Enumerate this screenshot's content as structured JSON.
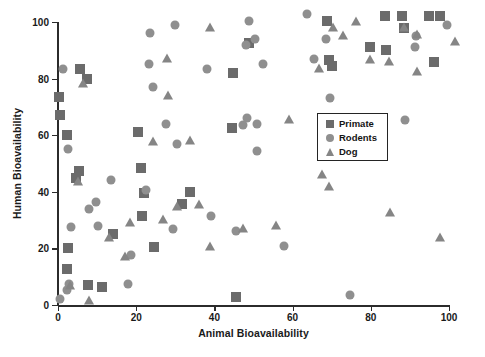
{
  "chart_data": {
    "type": "scatter",
    "title": "",
    "xlabel": "Animal Bioavailability",
    "ylabel": "Human Bioavailability",
    "xlim": [
      0,
      100
    ],
    "ylim": [
      0,
      100
    ],
    "xticks": [
      0,
      20,
      40,
      60,
      80,
      100
    ],
    "yticks": [
      0,
      20,
      40,
      60,
      80,
      100
    ],
    "grid": false,
    "legend_position": "center-right-inside",
    "series": [
      {
        "name": "Primate",
        "marker": "square",
        "color": "#6b6b6b",
        "points": [
          [
            0.3,
            73.5
          ],
          [
            0.6,
            67.0
          ],
          [
            2.3,
            60.0
          ],
          [
            2.6,
            20.0
          ],
          [
            2.2,
            12.8
          ],
          [
            4.6,
            45.0
          ],
          [
            5.6,
            83.5
          ],
          [
            7.4,
            80.0
          ],
          [
            5.4,
            47.5
          ],
          [
            7.6,
            7.0
          ],
          [
            11.2,
            6.5
          ],
          [
            14.0,
            25.0
          ],
          [
            20.4,
            61.0
          ],
          [
            21.2,
            48.5
          ],
          [
            21.4,
            31.5
          ],
          [
            22.0,
            39.5
          ],
          [
            24.6,
            20.5
          ],
          [
            31.8,
            35.8
          ],
          [
            33.8,
            40.0
          ],
          [
            44.8,
            82.0
          ],
          [
            44.5,
            62.5
          ],
          [
            45.4,
            3.0
          ],
          [
            48.8,
            92.5
          ],
          [
            69.2,
            86.5
          ],
          [
            70.2,
            84.5
          ],
          [
            68.8,
            100.5
          ],
          [
            79.8,
            91.0
          ],
          [
            83.6,
            102.0
          ],
          [
            84.0,
            90.0
          ],
          [
            88.0,
            102.0
          ],
          [
            88.6,
            98.0
          ],
          [
            95.0,
            102.0
          ],
          [
            97.6,
            102.0
          ],
          [
            96.2,
            86.0
          ]
        ]
      },
      {
        "name": "Rodents",
        "marker": "circle",
        "color": "#8f8f8f",
        "points": [
          [
            0.4,
            2.0
          ],
          [
            1.2,
            83.5
          ],
          [
            2.6,
            55.0
          ],
          [
            2.8,
            7.5
          ],
          [
            2.4,
            5.2
          ],
          [
            3.4,
            27.5
          ],
          [
            8.0,
            34.0
          ],
          [
            9.6,
            36.5
          ],
          [
            10.2,
            28.0
          ],
          [
            13.6,
            44.2
          ],
          [
            18.0,
            7.5
          ],
          [
            18.6,
            17.5
          ],
          [
            23.2,
            85.0
          ],
          [
            23.6,
            96.0
          ],
          [
            24.2,
            77.0
          ],
          [
            22.4,
            40.5
          ],
          [
            27.6,
            64.0
          ],
          [
            29.4,
            27.0
          ],
          [
            30.0,
            99.0
          ],
          [
            30.4,
            57.0
          ],
          [
            39.2,
            31.5
          ],
          [
            38.2,
            83.5
          ],
          [
            45.6,
            26.0
          ],
          [
            47.4,
            63.5
          ],
          [
            48.4,
            66.0
          ],
          [
            48.2,
            92.0
          ],
          [
            48.8,
            100.5
          ],
          [
            50.4,
            94.0
          ],
          [
            50.8,
            64.0
          ],
          [
            50.8,
            54.5
          ],
          [
            52.4,
            85.0
          ],
          [
            57.8,
            21.0
          ],
          [
            63.8,
            103.0
          ],
          [
            65.4,
            87.0
          ],
          [
            68.6,
            94.0
          ],
          [
            69.6,
            73.0
          ],
          [
            74.8,
            3.5
          ],
          [
            88.8,
            65.5
          ],
          [
            91.6,
            95.0
          ],
          [
            91.4,
            91.0
          ],
          [
            99.6,
            99.0
          ]
        ]
      },
      {
        "name": "Dog",
        "marker": "triangle",
        "color": "#858585",
        "points": [
          [
            3.0,
            6.8
          ],
          [
            5.0,
            43.5
          ],
          [
            6.4,
            78.0
          ],
          [
            8.0,
            1.5
          ],
          [
            13.0,
            23.5
          ],
          [
            17.2,
            17.0
          ],
          [
            18.4,
            29.0
          ],
          [
            26.8,
            30.0
          ],
          [
            30.4,
            34.5
          ],
          [
            24.2,
            57.5
          ],
          [
            27.8,
            87.0
          ],
          [
            28.2,
            74.0
          ],
          [
            33.8,
            58.0
          ],
          [
            36.0,
            35.5
          ],
          [
            39.0,
            20.5
          ],
          [
            38.8,
            98.0
          ],
          [
            47.4,
            26.8
          ],
          [
            55.8,
            28.0
          ],
          [
            59.2,
            65.5
          ],
          [
            67.6,
            46.0
          ],
          [
            69.4,
            41.8
          ],
          [
            66.8,
            83.5
          ],
          [
            70.4,
            98.0
          ],
          [
            72.8,
            95.0
          ],
          [
            76.2,
            100.0
          ],
          [
            79.8,
            86.5
          ],
          [
            84.8,
            32.5
          ],
          [
            84.6,
            86.0
          ],
          [
            88.6,
            98.0
          ],
          [
            91.8,
            95.5
          ],
          [
            91.8,
            82.5
          ],
          [
            97.6,
            23.5
          ],
          [
            101.5,
            93.0
          ]
        ]
      }
    ]
  },
  "axes": {
    "x": {
      "label": "Animal Bioavailability",
      "tick_labels": [
        "0",
        "20",
        "40",
        "60",
        "80",
        "100"
      ]
    },
    "y": {
      "label": "Human Bioavailability",
      "tick_labels": [
        "0",
        "20",
        "40",
        "60",
        "80",
        "100"
      ]
    }
  },
  "legend": {
    "items": [
      {
        "label": "Primate",
        "marker": "square-icon",
        "color": "#6b6b6b"
      },
      {
        "label": "Rodents",
        "marker": "circle-icon",
        "color": "#8f8f8f"
      },
      {
        "label": "Dog",
        "marker": "triangle-icon",
        "color": "#858585"
      }
    ]
  }
}
